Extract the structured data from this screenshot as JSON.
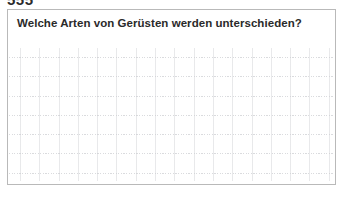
{
  "page": {
    "header_fragment": "555",
    "background_color": "#ffffff"
  },
  "answer_card": {
    "border_color": "#b9b9b9",
    "background_color": "#ffffff",
    "question": "Welche Arten von Gerüsten werden unterschieden?",
    "answer_area": {
      "content": "",
      "grid": {
        "type": "graph-paper",
        "vertical_line_color": "#c4c6cb",
        "horizontal_line_color": "#b0b2b8",
        "vertical_line_style": "solid",
        "horizontal_line_style": "dotted",
        "cell_size_px": 19,
        "columns": 17,
        "rows": 7
      }
    }
  }
}
